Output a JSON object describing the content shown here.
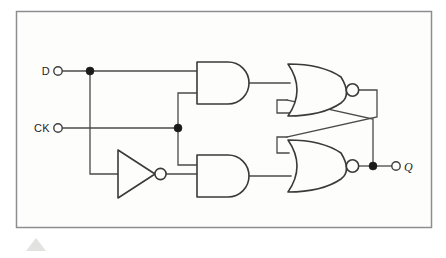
{
  "figure": {
    "background_color": "#fdfdfc",
    "page_color": "#ffffff",
    "frame": {
      "stroke_color": "#8d8d8f",
      "x": 16,
      "y": 11,
      "width": 416,
      "height": 217
    },
    "wire_color": "#4a4a4a",
    "gate_color": "#3a3a3a",
    "junction_color": "#1b1b1b"
  },
  "labels": {
    "input_d": "D",
    "input_ck": "CK",
    "output_q": "Q"
  },
  "terminals": [
    {
      "name": "d-input-terminal",
      "label": "D",
      "cx": 58,
      "cy": 71,
      "r": 4.2
    },
    {
      "name": "ck-input-terminal",
      "label": "CK",
      "cx": 58,
      "cy": 128,
      "r": 4.2
    },
    {
      "name": "q-output-terminal",
      "label": "Q",
      "cx": 396,
      "cy": 166,
      "r": 4.2
    }
  ],
  "junctions": [
    {
      "name": "d-fanout-junction",
      "cx": 90,
      "cy": 71,
      "r": 4.0
    },
    {
      "name": "ck-fanout-junction",
      "cx": 178,
      "cy": 128,
      "r": 4.0
    },
    {
      "name": "q-fanout-junction",
      "cx": 373,
      "cy": 166,
      "r": 4.0
    }
  ],
  "gates": [
    {
      "name": "and-gate-top",
      "type": "AND",
      "inputs": [
        "D",
        "CK"
      ],
      "output": "S",
      "x": 197,
      "y": 62,
      "width": 52,
      "height": 42
    },
    {
      "name": "and-gate-bottom",
      "type": "AND",
      "inputs": [
        "CK",
        "D-inverted"
      ],
      "output": "R",
      "x": 197,
      "y": 155,
      "width": 52,
      "height": 42
    },
    {
      "name": "inverter-gate",
      "type": "NOT",
      "inputs": [
        "D"
      ],
      "output": "D-inverted",
      "x": 108,
      "y": 150,
      "width": 48,
      "height": 48
    },
    {
      "name": "nor-gate-top",
      "type": "NOR",
      "inputs": [
        "S",
        "Q"
      ],
      "output": "Q-not",
      "x": 288,
      "y": 64,
      "width": 60,
      "height": 52
    },
    {
      "name": "nor-gate-bottom",
      "type": "NOR",
      "inputs": [
        "Q-not",
        "R"
      ],
      "output": "Q",
      "x": 288,
      "y": 140,
      "width": 60,
      "height": 52
    }
  ],
  "nets": [
    {
      "name": "net-d-to-and-top",
      "description": "D input to top AND gate upper input"
    },
    {
      "name": "net-d-to-inverter",
      "description": "D branch down to inverter input"
    },
    {
      "name": "net-ck-to-and-top",
      "description": "CK up to top AND gate lower input"
    },
    {
      "name": "net-ck-to-and-bottom",
      "description": "CK down to bottom AND gate upper input"
    },
    {
      "name": "net-inv-to-and-bottom",
      "description": "Inverter output to bottom AND gate lower input"
    },
    {
      "name": "net-and-top-to-nor-top",
      "description": "Top AND output to top NOR upper input"
    },
    {
      "name": "net-and-bot-to-nor-bot",
      "description": "Bottom AND output to bottom NOR lower input"
    },
    {
      "name": "net-cross-top-to-bottom",
      "description": "Top NOR output crosses to bottom NOR upper input"
    },
    {
      "name": "net-cross-bottom-to-top",
      "description": "Bottom NOR output crosses to top NOR lower input"
    },
    {
      "name": "net-q-output",
      "description": "Bottom NOR output to Q terminal"
    }
  ]
}
